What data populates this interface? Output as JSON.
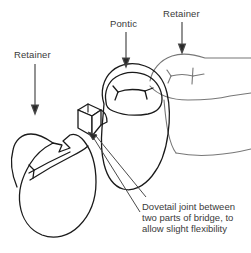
{
  "figure": {
    "background_color": "#ffffff",
    "ink_color": "#1a1a1a",
    "light_ink_color": "#8a8a8a",
    "text_color": "#3a3a3a",
    "width": 251,
    "height": 253
  },
  "labels": {
    "retainer_left": "Retainer",
    "pontic": "Pontic",
    "retainer_right": "Retainer"
  },
  "caption": {
    "line1": "Dovetail joint between",
    "line2": "two parts of bridge, to",
    "line3": "allow slight flexibility"
  },
  "parts": [
    {
      "name": "retainer-left-tooth",
      "role": "Retainer",
      "position": "left"
    },
    {
      "name": "pontic-tooth",
      "role": "Pontic",
      "position": "center"
    },
    {
      "name": "retainer-right-tooth",
      "role": "Retainer",
      "position": "right"
    },
    {
      "name": "dovetail-joint",
      "role": "Dovetail joint",
      "position": "between left retainer and pontic"
    }
  ]
}
